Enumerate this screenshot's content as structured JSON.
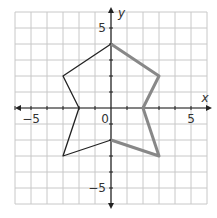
{
  "chart_data": {
    "type": "line",
    "title": "",
    "xlabel": "x",
    "ylabel": "y",
    "xlim": [
      -6,
      6
    ],
    "ylim": [
      -6,
      6
    ],
    "grid": true,
    "tick_labels": {
      "x": [
        "-5",
        "0",
        "5"
      ],
      "y": [
        "5",
        "-5"
      ]
    },
    "series": [
      {
        "name": "black-left-half",
        "color": "#222222",
        "points": [
          [
            0,
            4
          ],
          [
            -3,
            2
          ],
          [
            -2,
            0
          ],
          [
            -3,
            -3
          ],
          [
            0,
            -2
          ]
        ]
      },
      {
        "name": "gray-right-half",
        "color": "#888888",
        "points": [
          [
            0,
            4
          ],
          [
            3,
            2
          ],
          [
            2,
            0
          ],
          [
            3,
            -3
          ],
          [
            0,
            -2
          ]
        ]
      }
    ]
  },
  "labels": {
    "x_axis": "x",
    "y_axis": "y",
    "neg5x": "−5",
    "pos5x": "5",
    "origin": "0",
    "pos5y": "5",
    "neg5y": "−5"
  }
}
